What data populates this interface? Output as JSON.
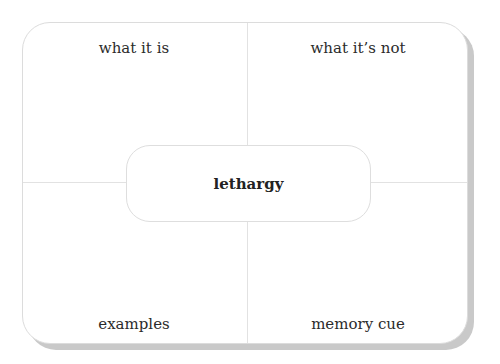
{
  "diagram": {
    "type": "frayer-model",
    "center_term": "lethargy",
    "quadrants": {
      "top_left": "what it is",
      "top_right": "what it’s not",
      "bottom_left": "examples",
      "bottom_right": "memory cue"
    }
  }
}
